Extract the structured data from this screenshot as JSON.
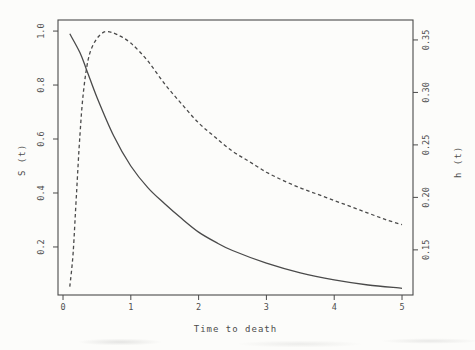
{
  "meta": {
    "background_color": "#fcfcfa",
    "ink_color": "#4a4a4a"
  },
  "chart_data": {
    "type": "line",
    "title": "",
    "xlabel": "Time to death",
    "left_ylabel": "S (t)",
    "right_ylabel": "h (t)",
    "grid": false,
    "legend": "none",
    "x_range": [
      -0.074,
      5.162
    ],
    "left_range": [
      0.022,
      1.041
    ],
    "right_range": [
      0.107,
      0.369
    ],
    "x_ticks": [
      {
        "v": 0,
        "label": "0"
      },
      {
        "v": 1,
        "label": "1"
      },
      {
        "v": 2,
        "label": "2"
      },
      {
        "v": 3,
        "label": "3"
      },
      {
        "v": 4,
        "label": "4"
      },
      {
        "v": 5,
        "label": "5"
      }
    ],
    "left_ticks": [
      {
        "v": 0.2,
        "label": "0.2"
      },
      {
        "v": 0.4,
        "label": "0.4"
      },
      {
        "v": 0.6,
        "label": "0.6"
      },
      {
        "v": 0.8,
        "label": "0.8"
      },
      {
        "v": 1.0,
        "label": "1.0"
      }
    ],
    "right_ticks": [
      {
        "v": 0.15,
        "label": "0.15"
      },
      {
        "v": 0.2,
        "label": "0.20"
      },
      {
        "v": 0.25,
        "label": "0.25"
      },
      {
        "v": 0.3,
        "label": "0.30"
      },
      {
        "v": 0.35,
        "label": "0.35"
      }
    ],
    "series": [
      {
        "name": "survival function S(t)",
        "axis": "left",
        "line_style": "solid",
        "points": [
          [
            0.1,
            0.99
          ],
          [
            0.25,
            0.92
          ],
          [
            0.35,
            0.855
          ],
          [
            0.5,
            0.755
          ],
          [
            0.75,
            0.61
          ],
          [
            1.0,
            0.5
          ],
          [
            1.25,
            0.42
          ],
          [
            1.5,
            0.36
          ],
          [
            1.75,
            0.305
          ],
          [
            2.0,
            0.255
          ],
          [
            2.25,
            0.218
          ],
          [
            2.5,
            0.187
          ],
          [
            3.0,
            0.14
          ],
          [
            3.5,
            0.104
          ],
          [
            4.0,
            0.078
          ],
          [
            4.5,
            0.059
          ],
          [
            5.0,
            0.047
          ]
        ]
      },
      {
        "name": "hazard function h(t)",
        "axis": "right",
        "line_style": "dashed",
        "points": [
          [
            0.1,
            0.115
          ],
          [
            0.15,
            0.148
          ],
          [
            0.2,
            0.205
          ],
          [
            0.25,
            0.26
          ],
          [
            0.3,
            0.3
          ],
          [
            0.37,
            0.331
          ],
          [
            0.45,
            0.346
          ],
          [
            0.55,
            0.355
          ],
          [
            0.65,
            0.358
          ],
          [
            0.8,
            0.355
          ],
          [
            1.0,
            0.347
          ],
          [
            1.25,
            0.33
          ],
          [
            1.5,
            0.308
          ],
          [
            1.75,
            0.289
          ],
          [
            2.0,
            0.271
          ],
          [
            2.25,
            0.257
          ],
          [
            2.5,
            0.244
          ],
          [
            2.75,
            0.234
          ],
          [
            3.0,
            0.224
          ],
          [
            3.25,
            0.216
          ],
          [
            3.5,
            0.209
          ],
          [
            3.75,
            0.203
          ],
          [
            4.0,
            0.197
          ],
          [
            4.25,
            0.191
          ],
          [
            4.5,
            0.185
          ],
          [
            4.75,
            0.179
          ],
          [
            5.0,
            0.174
          ]
        ]
      }
    ]
  }
}
